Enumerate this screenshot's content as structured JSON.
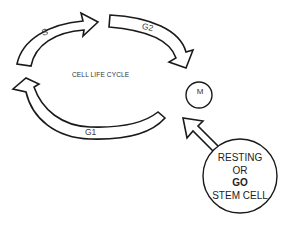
{
  "diagram": {
    "title": "CELL LIFE CYCLE",
    "phases": [
      {
        "id": "S",
        "label": "S"
      },
      {
        "id": "G2",
        "label": "G2"
      },
      {
        "id": "M",
        "label": "M"
      },
      {
        "id": "G1",
        "label": "G1"
      }
    ],
    "stem_cell": {
      "line1": "RESTING",
      "line2": "OR",
      "line3": "GO",
      "line4": "STEM CELL"
    },
    "colors": {
      "stroke": "#1a1a1a",
      "fill": "#ffffff",
      "text": "#333333"
    }
  }
}
